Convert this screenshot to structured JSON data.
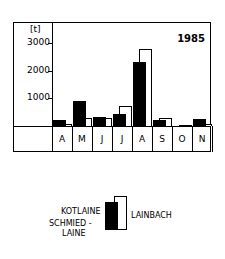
{
  "chart_data": {
    "type": "bar",
    "title": "1985",
    "ylabel": "[t]",
    "xlabel": "",
    "ylim": [
      0,
      3500
    ],
    "yticks": [
      1000,
      2000,
      3000
    ],
    "grid": false,
    "legend_position": "bottom-center",
    "categories": [
      "A",
      "M",
      "J",
      "J",
      "A",
      "S",
      "O",
      "N"
    ],
    "series": [
      {
        "name": "KOTLAINE SCHMIED-LAINE",
        "style": "filled-black",
        "values": [
          200,
          900,
          320,
          430,
          2300,
          200,
          0,
          240
        ]
      },
      {
        "name": "LAINBACH",
        "style": "outline-white",
        "values": [
          80,
          300,
          300,
          700,
          2750,
          300,
          30,
          60
        ]
      }
    ]
  },
  "labels": {
    "unit": "[t]",
    "year": "1985",
    "ticks": [
      "3000",
      "2000",
      "1000"
    ],
    "months": [
      "A",
      "M",
      "J",
      "J",
      "A",
      "S",
      "O",
      "N"
    ],
    "legend_black_1": "KOTLAINE",
    "legend_black_2": "SCHMIED -",
    "legend_black_3": "LAINE",
    "legend_white": "LAINBACH"
  }
}
